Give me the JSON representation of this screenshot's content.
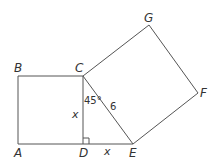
{
  "diagram": {
    "type": "geometry",
    "points": {
      "A": {
        "label": "A",
        "x": 18,
        "y": 144
      },
      "B": {
        "label": "B",
        "x": 18,
        "y": 76
      },
      "C": {
        "label": "C",
        "x": 83,
        "y": 76
      },
      "D": {
        "label": "D",
        "x": 83,
        "y": 144
      },
      "E": {
        "label": "E",
        "x": 133,
        "y": 144
      },
      "F": {
        "label": "F",
        "x": 198,
        "y": 93
      },
      "G": {
        "label": "G",
        "x": 149,
        "y": 25
      }
    },
    "labels": {
      "side_CD": "x",
      "side_DE": "x",
      "hypotenuse_CE": "6",
      "angle_DCE": "45°",
      "right_angle_at": "D"
    },
    "stroke_color": "#555555",
    "text_color": "#333333"
  }
}
